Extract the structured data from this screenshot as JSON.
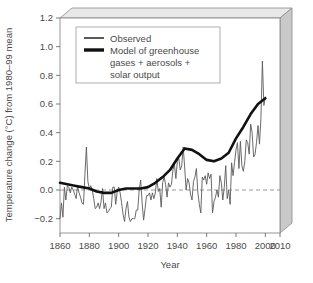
{
  "chart_data": {
    "type": "line",
    "title": "",
    "xlabel": "Year",
    "ylabel": "Temperature change (°C) from 1980–99 mean",
    "xlim": [
      1860,
      2010
    ],
    "ylim": [
      -0.3,
      1.2
    ],
    "xticks": [
      1860,
      1880,
      1900,
      1920,
      1940,
      1960,
      1980,
      2000,
      2010
    ],
    "xticklabels": [
      "1860",
      "1880",
      "1900",
      "1920",
      "1940",
      "1960",
      "1980",
      "2000",
      "2010"
    ],
    "yticks": [
      -0.2,
      0.0,
      0.2,
      0.4,
      0.6,
      0.8,
      1.0,
      1.2
    ],
    "yticklabels": [
      "−0.2",
      "0.0",
      "0.2",
      "0.4",
      "0.6",
      "0.8",
      "1.0",
      "1.2"
    ],
    "grid": false,
    "reference_line": {
      "y": 0.0,
      "style": "dashed",
      "color": "#8c8c8c"
    },
    "legend_position": "top-left",
    "series": [
      {
        "name": "Observed",
        "color": "#5a5a5a",
        "width": 0.9,
        "x": [
          1860,
          1861,
          1862,
          1863,
          1864,
          1865,
          1866,
          1867,
          1868,
          1869,
          1870,
          1871,
          1872,
          1873,
          1874,
          1875,
          1876,
          1877,
          1878,
          1879,
          1880,
          1881,
          1882,
          1883,
          1884,
          1885,
          1886,
          1887,
          1888,
          1889,
          1890,
          1891,
          1892,
          1893,
          1894,
          1895,
          1896,
          1897,
          1898,
          1899,
          1900,
          1901,
          1902,
          1903,
          1904,
          1905,
          1906,
          1907,
          1908,
          1909,
          1910,
          1911,
          1912,
          1913,
          1914,
          1915,
          1916,
          1917,
          1918,
          1919,
          1920,
          1921,
          1922,
          1923,
          1924,
          1925,
          1926,
          1927,
          1928,
          1929,
          1930,
          1931,
          1932,
          1933,
          1934,
          1935,
          1936,
          1937,
          1938,
          1939,
          1940,
          1941,
          1942,
          1943,
          1944,
          1945,
          1946,
          1947,
          1948,
          1949,
          1950,
          1951,
          1952,
          1953,
          1954,
          1955,
          1956,
          1957,
          1958,
          1959,
          1960,
          1961,
          1962,
          1963,
          1964,
          1965,
          1966,
          1967,
          1968,
          1969,
          1970,
          1971,
          1972,
          1973,
          1974,
          1975,
          1976,
          1977,
          1978,
          1979,
          1980,
          1981,
          1982,
          1983,
          1984,
          1985,
          1986,
          1987,
          1988,
          1989,
          1990,
          1991,
          1992,
          1993,
          1994,
          1995,
          1996,
          1997,
          1998,
          1999,
          2000
        ],
        "values": [
          -0.2,
          -0.09,
          -0.19,
          0.02,
          -0.07,
          0.03,
          0.02,
          -0.02,
          0.02,
          0.0,
          -0.03,
          -0.06,
          0.03,
          -0.02,
          -0.05,
          -0.09,
          -0.1,
          0.11,
          0.3,
          0.06,
          0.01,
          0.03,
          0.0,
          -0.06,
          -0.13,
          -0.12,
          -0.09,
          -0.13,
          -0.08,
          0.01,
          -0.13,
          -0.09,
          -0.16,
          -0.15,
          -0.13,
          -0.12,
          0.02,
          0.02,
          -0.1,
          -0.01,
          0.02,
          -0.02,
          -0.09,
          -0.17,
          -0.22,
          -0.13,
          -0.08,
          -0.19,
          -0.22,
          -0.2,
          -0.2,
          -0.2,
          -0.14,
          -0.14,
          0.0,
          0.07,
          -0.09,
          -0.21,
          -0.13,
          -0.04,
          -0.04,
          -0.02,
          -0.07,
          -0.02,
          -0.06,
          -0.02,
          0.08,
          -0.01,
          0.01,
          -0.12,
          0.05,
          0.09,
          0.04,
          -0.05,
          0.05,
          0.02,
          0.04,
          0.14,
          0.18,
          0.08,
          0.2,
          0.22,
          0.14,
          0.17,
          0.3,
          0.16,
          0.0,
          0.08,
          0.05,
          -0.03,
          -0.07,
          0.06,
          0.09,
          0.15,
          -0.02,
          -0.1,
          -0.16,
          0.09,
          0.07,
          0.1,
          0.04,
          0.12,
          0.08,
          0.11,
          -0.16,
          -0.08,
          -0.05,
          0.0,
          -0.05,
          0.1,
          0.05,
          -0.07,
          0.02,
          0.17,
          -0.06,
          0.0,
          -0.1,
          0.19,
          0.1,
          0.19,
          0.28,
          0.33,
          0.15,
          0.34,
          0.17,
          0.13,
          0.2,
          0.35,
          0.33,
          0.25,
          0.46,
          0.4,
          0.23,
          0.25,
          0.33,
          0.45,
          0.32,
          0.5,
          0.9,
          0.59,
          0.65
        ]
      },
      {
        "name": "Model of greenhouse gases + aerosols + solar output",
        "color": "#111111",
        "width": 2.6,
        "x": [
          1860,
          1865,
          1870,
          1875,
          1880,
          1885,
          1890,
          1895,
          1900,
          1905,
          1910,
          1915,
          1920,
          1925,
          1930,
          1935,
          1940,
          1945,
          1950,
          1955,
          1960,
          1965,
          1970,
          1975,
          1980,
          1985,
          1990,
          1995,
          2000
        ],
        "values": [
          0.05,
          0.04,
          0.03,
          0.02,
          0.01,
          -0.01,
          -0.02,
          -0.02,
          0.0,
          0.01,
          0.01,
          0.01,
          0.02,
          0.05,
          0.09,
          0.14,
          0.22,
          0.29,
          0.28,
          0.25,
          0.21,
          0.2,
          0.22,
          0.26,
          0.36,
          0.44,
          0.53,
          0.6,
          0.64
        ]
      }
    ],
    "legend": [
      {
        "label": "Observed",
        "color": "#5a5a5a",
        "thickness": "thin"
      },
      {
        "label": "Model of greenhouse",
        "color": "#111111",
        "thickness": "thick"
      },
      {
        "label": "gases + aerosols +",
        "color": "",
        "thickness": ""
      },
      {
        "label": "solar output",
        "color": "",
        "thickness": ""
      }
    ],
    "frame": {
      "style": "pseudo-3d-box",
      "face_color": "#ffffff",
      "side_color": "#c9c9c9",
      "top_color": "#e3e3e3",
      "edge_color": "#8a8a8a"
    }
  }
}
